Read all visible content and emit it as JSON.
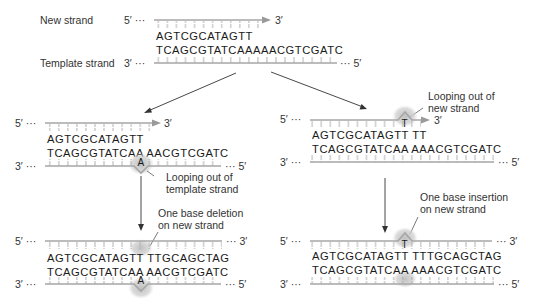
{
  "figure": {
    "type": "dna-replication-slippage-diagram",
    "colors": {
      "strand": "#a6a6a6",
      "tick": "#a6a6a6",
      "arrow": "#9a9a9a",
      "loop_highlight": "#c8c8c8",
      "text": "#222222",
      "connector": "#333333"
    }
  },
  "top": {
    "new_strand_label": "New strand",
    "template_strand_label": "Template strand",
    "new_strand_5": "5′ ···",
    "new_strand_3": "3′",
    "new_seq": "AGTCGCATAGTT",
    "template_seq": "TCAGCGTATCAAAAACGTCGATC",
    "template_3": "3′ ···",
    "template_5": "··· 5′"
  },
  "left_mid": {
    "new_5": "5′ ···",
    "new_3": "3′",
    "new_seq": "AGTCGCATAGTT",
    "template_seq": "TCAGCGTATCAA AACGTCGATC",
    "looped_base": "A",
    "template_3": "3′ ···",
    "template_5": "··· 5′",
    "annotation_line1": "Looping out of",
    "annotation_line2": "template strand"
  },
  "right_mid": {
    "new_5": "5′ ···",
    "new_3": "3′",
    "new_seq": "AGTCGCATAGTT TT",
    "looped_base": "T",
    "template_seq": "TCAGCGTATCAA AAACGTCGATC",
    "template_3": "3′ ···",
    "template_5": "··· 5′",
    "annotation_line1": "Looping out of",
    "annotation_line2": "new strand"
  },
  "left_bottom": {
    "annotation_line1": "One base deletion",
    "annotation_line2": "on new strand",
    "new_5": "5′ ···",
    "new_3": "··· 3′",
    "new_seq": "AGTCGCATAGTT TTGCAGCTAG",
    "template_seq": "TCAGCGTATCAA AACGTCGATC",
    "looped_base": "A",
    "template_3": "3′ ···",
    "template_5": "··· 5′"
  },
  "right_bottom": {
    "annotation_line1": "One base insertion",
    "annotation_line2": "on new strand",
    "new_5": "5′ ···",
    "new_3": "··· 3′",
    "new_seq": "AGTCGCATAGTT TTTGCAGCTAG",
    "looped_base": "T",
    "template_seq": "TCAGCGTATCAA AAACGTCGATC",
    "template_3": "3′ ···",
    "template_5": "··· 5′"
  }
}
